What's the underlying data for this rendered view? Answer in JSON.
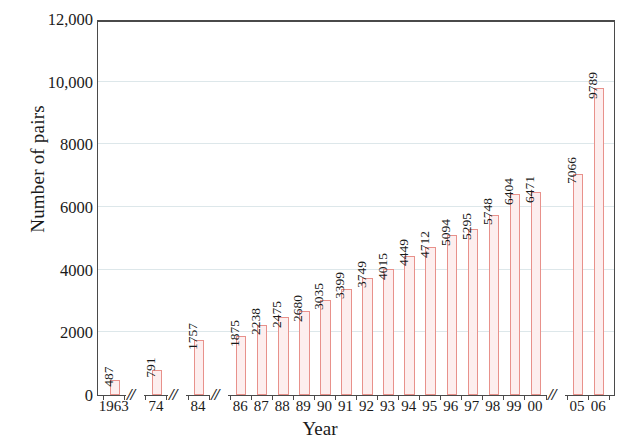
{
  "chart_data": {
    "type": "bar",
    "title": "",
    "xlabel": "Year",
    "ylabel": "Number of pairs",
    "ylim": [
      0,
      12000
    ],
    "grid": true,
    "legend_position": "none",
    "y_ticks": [
      {
        "value": 0,
        "label": "0"
      },
      {
        "value": 2000,
        "label": "2000"
      },
      {
        "value": 4000,
        "label": "4000"
      },
      {
        "value": 6000,
        "label": "6000"
      },
      {
        "value": 8000,
        "label": "8000"
      },
      {
        "value": 10000,
        "label": "10,000"
      },
      {
        "value": 12000,
        "label": "12,000"
      }
    ],
    "axis_breaks": [
      {
        "after_category": "1963",
        "symbol": "//"
      },
      {
        "after_category": "74",
        "symbol": "//"
      },
      {
        "after_category": "84",
        "symbol": "//"
      },
      {
        "after_category": "00",
        "symbol": "//"
      }
    ],
    "categories": [
      "1963",
      "74",
      "84",
      "86",
      "87",
      "88",
      "89",
      "90",
      "91",
      "92",
      "93",
      "94",
      "95",
      "96",
      "97",
      "98",
      "99",
      "00",
      "05",
      "06"
    ],
    "values": [
      487,
      791,
      1757,
      1875,
      2238,
      2475,
      2680,
      3035,
      3399,
      3749,
      4015,
      4449,
      4712,
      5094,
      5295,
      5748,
      6404,
      6471,
      7066,
      9789
    ],
    "data_labels": [
      "487",
      "791",
      "1757",
      "1875",
      "2238",
      "2475",
      "2680",
      "3035",
      "3399",
      "3749",
      "4015",
      "4449",
      "4712",
      "5094",
      "5295",
      "5748",
      "6404",
      "6471",
      "7066",
      "9789"
    ],
    "colors": {
      "bar_outline": "#e8918b",
      "bar_fill": "#fdeeee",
      "gridline": "#dde7ea",
      "axis": "#4a4a4a",
      "text": "#1a1a1a"
    }
  }
}
